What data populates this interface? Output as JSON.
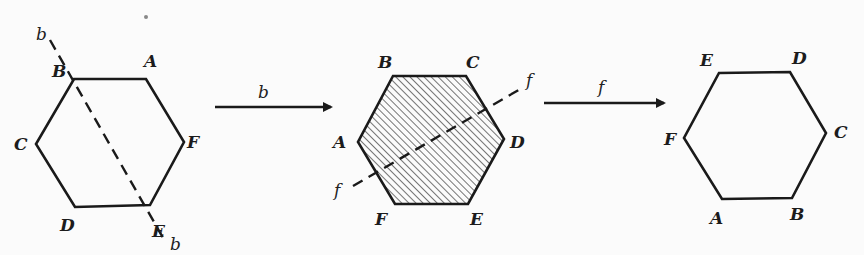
{
  "diagram": {
    "colors": {
      "ink": "#1a1a1a",
      "background": "#fbfbfb"
    },
    "hexagons": [
      {
        "id": "initial",
        "shaded": false,
        "vertices": {
          "top_left": "B",
          "top_right": "A",
          "right": "F",
          "bottom_right": "E",
          "bottom_left": "D",
          "left": "C"
        },
        "axis": {
          "label": "b",
          "through": [
            "B",
            "E"
          ],
          "label_top": "b",
          "label_bottom": "b"
        }
      },
      {
        "id": "after-b",
        "shaded": true,
        "vertices": {
          "top_left": "B",
          "top_right": "C",
          "right": "D",
          "bottom_right": "E",
          "bottom_left": "F",
          "left": "A"
        },
        "axis": {
          "label": "f",
          "label_top": "f",
          "label_bottom": "f"
        }
      },
      {
        "id": "after-f",
        "shaded": false,
        "vertices": {
          "top_left": "E",
          "top_right": "D",
          "right": "C",
          "bottom_right": "B",
          "bottom_left": "A",
          "left": "F"
        }
      }
    ],
    "arrows": [
      {
        "label": "b",
        "from": "initial",
        "to": "after-b"
      },
      {
        "label": "f",
        "from": "after-b",
        "to": "after-f"
      }
    ]
  }
}
